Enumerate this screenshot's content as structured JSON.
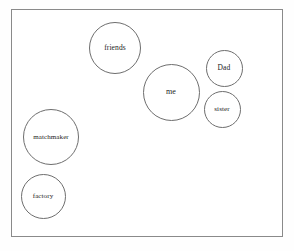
{
  "diagram": {
    "background_color": "#ffffff",
    "frame": {
      "name": "diagram-frame",
      "border_color": "#8a8a8a",
      "x": 11,
      "y": 9,
      "width": 272,
      "height": 228
    },
    "node_style": {
      "fill_color": "#ffffff",
      "stroke_color": "#6e6e6e",
      "text_color": "#1c1c1c"
    },
    "nodes": [
      {
        "id": "friends",
        "label": "friends",
        "cx": 114,
        "cy": 47,
        "diameter": 52,
        "font_size": 7.5
      },
      {
        "id": "me",
        "label": "me",
        "cx": 170,
        "cy": 91,
        "diameter": 57,
        "font_size": 8
      },
      {
        "id": "dad",
        "label": "Dad",
        "cx": 223,
        "cy": 67,
        "diameter": 37,
        "font_size": 7.5
      },
      {
        "id": "sister",
        "label": "sister",
        "cx": 221,
        "cy": 108,
        "diameter": 37,
        "font_size": 7
      },
      {
        "id": "matchmaker",
        "label": "matchmaker",
        "cx": 50,
        "cy": 136,
        "diameter": 56,
        "font_size": 7
      },
      {
        "id": "factory",
        "label": "factory",
        "cx": 42,
        "cy": 195,
        "diameter": 45,
        "font_size": 7
      }
    ]
  }
}
